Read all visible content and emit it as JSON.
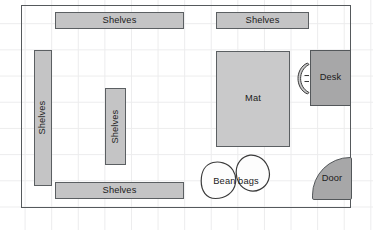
{
  "plan": {
    "title": "Room floor plan",
    "canvas": {
      "width": 373,
      "height": 230
    },
    "colors": {
      "background": "#ffffff",
      "grid_line": "#ececed",
      "wall_stroke": "#55595c",
      "shelf_fill": "#c4c4c5",
      "shelf_stroke": "#5b5f62",
      "mat_fill": "#c9c9ca",
      "desk_fill": "#a7a7a8",
      "door_fill": "#a7a7a8",
      "beanbag_fill": "#fdfdfd",
      "beanbag_stroke": "#3a3a3a",
      "label_text": "#1b1b1b"
    },
    "items": {
      "shelf_top_left": {
        "label": "Shelves",
        "orientation": "horizontal"
      },
      "shelf_top_right": {
        "label": "Shelves",
        "orientation": "horizontal"
      },
      "shelf_bottom": {
        "label": "Shelves",
        "orientation": "horizontal"
      },
      "shelf_left": {
        "label": "Shelves",
        "orientation": "vertical"
      },
      "shelf_middle": {
        "label": "Shelves",
        "orientation": "vertical"
      },
      "mat": {
        "label": "Mat"
      },
      "desk": {
        "label": "Desk"
      },
      "chair": {
        "label": ""
      },
      "beanbags": {
        "label": "Bean bags",
        "count": 2
      },
      "door": {
        "label": "Door"
      }
    }
  }
}
